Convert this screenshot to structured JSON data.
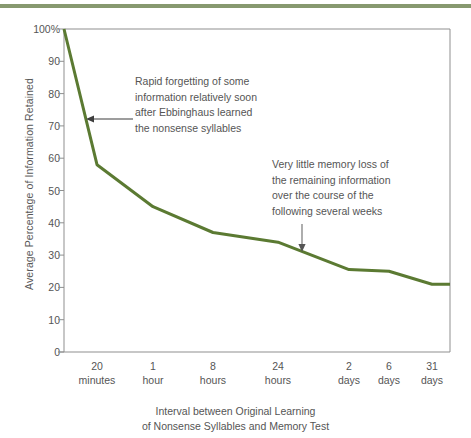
{
  "figure": {
    "accent_bar_color": "#87996f",
    "line_color": "#5b7a32",
    "axis_color": "#8a8a8a",
    "text_color": "#555555"
  },
  "chart_data": {
    "type": "line",
    "title": "",
    "xlabel": "Interval between Original Learning of Nonsense Syllables and Memory Test",
    "xlabel_line1": "Interval between Original Learning",
    "xlabel_line2": "of Nonsense Syllables and Memory Test",
    "ylabel": "Average Percentage of Information Retained",
    "ylim": [
      0,
      100
    ],
    "yticks": [
      0,
      10,
      20,
      30,
      40,
      50,
      60,
      70,
      80,
      90,
      100
    ],
    "ytick_labels": [
      "0",
      "10",
      "20",
      "30",
      "40",
      "50",
      "60",
      "70",
      "80",
      "90",
      "100%"
    ],
    "grid": false,
    "legend": "none",
    "categories": [
      "immediately",
      "20 minutes",
      "1 hour",
      "8 hours",
      "24 hours",
      "2 days",
      "6 days",
      "31 days"
    ],
    "xtick_labels": [
      {
        "value": "20",
        "unit": "minutes"
      },
      {
        "value": "1",
        "unit": "hour"
      },
      {
        "value": "8",
        "unit": "hours"
      },
      {
        "value": "24",
        "unit": "hours"
      },
      {
        "value": "2",
        "unit": "days"
      },
      {
        "value": "6",
        "unit": "days"
      },
      {
        "value": "31",
        "unit": "days"
      }
    ],
    "values": [
      100,
      58,
      45,
      37,
      34,
      25.5,
      25,
      21
    ],
    "series": [
      {
        "name": "Average Percentage of Information Retained",
        "values": [
          100,
          58,
          45,
          37,
          34,
          25.5,
          25,
          21
        ]
      }
    ],
    "annotations": [
      {
        "id": "rapid-forgetting",
        "lines": [
          "Rapid forgetting of some",
          "information relatively soon",
          "after Ebbinghaus learned",
          "the nonsense syllables"
        ],
        "arrow": "left"
      },
      {
        "id": "little-memory-loss",
        "lines": [
          "Very little memory loss of",
          "the remaining information",
          "over the course of the",
          "following several weeks"
        ],
        "arrow": "down"
      }
    ]
  }
}
